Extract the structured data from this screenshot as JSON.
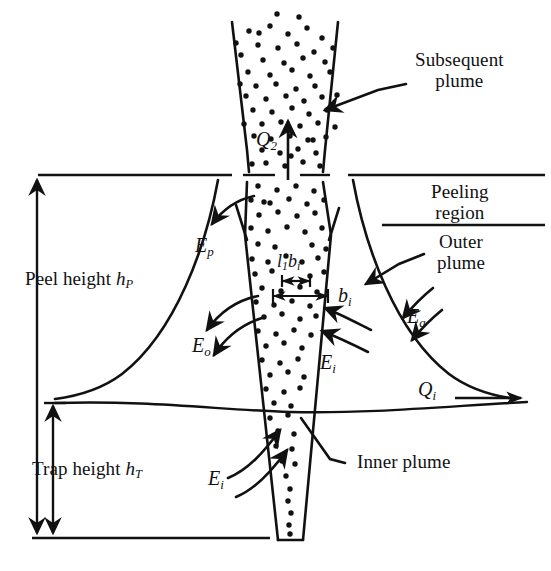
{
  "figure": {
    "kind": "plume-schematic",
    "background_color": "#ffffff",
    "ink_color": "#111111"
  },
  "labels": {
    "subsequent_plume_line1": "Subsequent",
    "subsequent_plume_line2": "plume",
    "peeling_region_line1": "Peeling",
    "peeling_region_line2": "region",
    "outer_plume_line1": "Outer",
    "outer_plume_line2": "plume",
    "inner_plume": "Inner plume",
    "peel_height_text": "Peel height",
    "peel_height_symbol": "h",
    "peel_height_subscript": "P",
    "trap_height_text": "Trap height",
    "trap_height_symbol": "h",
    "trap_height_subscript": "T"
  },
  "symbols": {
    "q2_base": "Q",
    "q2_sub": "2",
    "qi_base": "Q",
    "qi_sub": "i",
    "ep_base": "E",
    "ep_sub": "p",
    "eo_base": "E",
    "eo_sub": "o",
    "ei_base": "E",
    "ei_sub": "i",
    "ei_lower_base": "E",
    "ei_lower_sub": "i",
    "ea_base": "E",
    "ea_sub": "a",
    "bi_base": "b",
    "bi_sub": "i",
    "l1bi_l": "l",
    "l1bi_l_sub": "1",
    "l1bi_b": "b",
    "l1bi_b_sub": "i"
  },
  "regions": [
    {
      "name": "subsequent-plume",
      "description": "upward opening dotted cone above peeling region"
    },
    {
      "name": "peeling-region",
      "description": "horizontal band between two ruled lines"
    },
    {
      "name": "outer-plume",
      "description": "symmetric flaring curves descending to trap height"
    },
    {
      "name": "inner-plume",
      "description": "narrow downward tapering dotted cone"
    }
  ],
  "measures": [
    {
      "name": "peel-height",
      "label": "Peel height h_P",
      "from": "trap base line",
      "to": "peeling region top"
    },
    {
      "name": "trap-height",
      "label": "Trap height h_T",
      "from": "trap base line",
      "to": "ambient interface line"
    },
    {
      "name": "inner-plume-width",
      "label": "b_i"
    },
    {
      "name": "scaled-width",
      "label": "l_1 b_i"
    }
  ],
  "flows": [
    {
      "name": "Q2",
      "direction": "up",
      "description": "volume flux of subsequent plume"
    },
    {
      "name": "Qi",
      "direction": "right",
      "description": "intrusion flux at neutral level"
    },
    {
      "name": "Ep",
      "direction": "outward-left",
      "description": "peeling entrainment"
    },
    {
      "name": "Eo",
      "direction": "outward-left",
      "description": "outer plume entrainment"
    },
    {
      "name": "Ei",
      "direction": "inward-right",
      "description": "inner plume entrainment"
    },
    {
      "name": "Ea",
      "direction": "inward",
      "description": "ambient entrainment"
    }
  ]
}
